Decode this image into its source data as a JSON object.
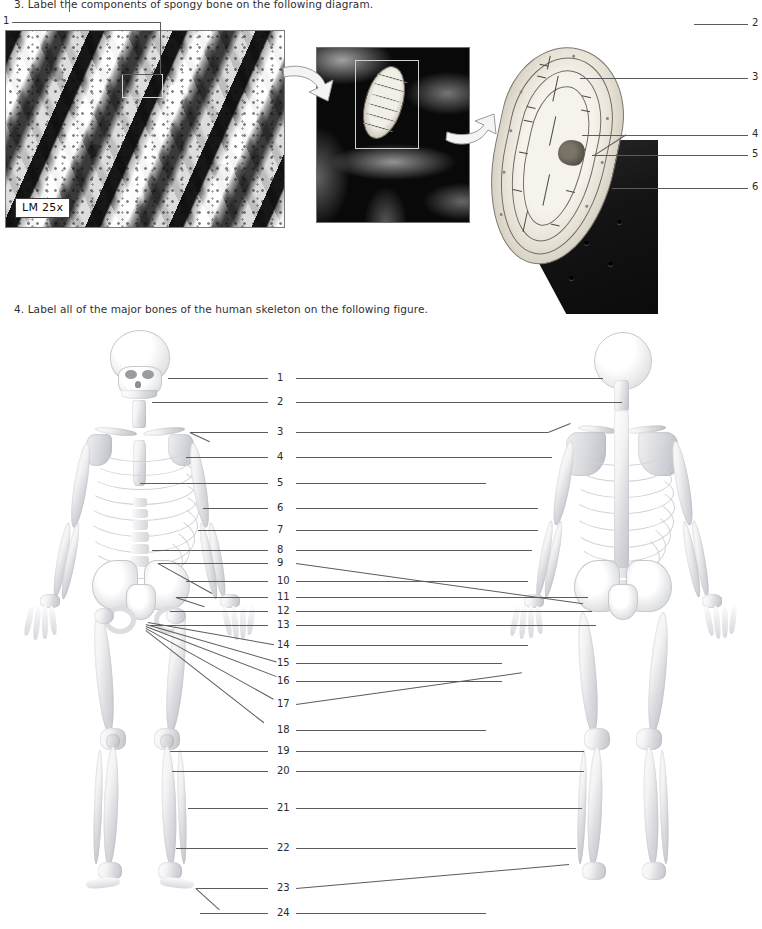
{
  "page": {
    "questions": [
      {
        "id": "q3",
        "text": "3. Label the components of spongy bone on the following diagram."
      },
      {
        "id": "q4",
        "text": "4. Label all of the major bones of the human skeleton on the following figure."
      }
    ]
  },
  "figure_spongy_bone": {
    "micrograph": {
      "magnification_badge": "LM 25x",
      "caption_alt": "light micrograph of spongy bone trabeculae"
    },
    "callout_numbers": [
      "1",
      "2",
      "3",
      "4",
      "5",
      "6"
    ],
    "labels": {
      "n1": "1",
      "n2": "2",
      "n3": "3",
      "n4": "4",
      "n5": "5",
      "n6": "6"
    }
  },
  "figure_skeleton": {
    "views": [
      {
        "name": "anterior-view",
        "alt": "anterior view of human skeleton"
      },
      {
        "name": "posterior-view",
        "alt": "posterior view of human skeleton"
      }
    ],
    "labels": {
      "n1": "1",
      "n2": "2",
      "n3": "3",
      "n4": "4",
      "n5": "5",
      "n6": "6",
      "n7": "7",
      "n8": "8",
      "n9": "9",
      "n10": "10",
      "n11": "11",
      "n12": "12",
      "n13": "13",
      "n14": "14",
      "n15": "15",
      "n16": "16",
      "n17": "17",
      "n18": "18",
      "n19": "19",
      "n20": "20",
      "n21": "21",
      "n22": "22",
      "n23": "23",
      "n24": "24"
    }
  },
  "colors": {
    "ink": "#2b2b2b",
    "leader_line": "#5c5c5c",
    "bone_light": "#f3f3f4",
    "bone_shadow": "#c3c4c9",
    "micrograph_dark": "#1d1d1d",
    "page_background": "#ffffff"
  }
}
